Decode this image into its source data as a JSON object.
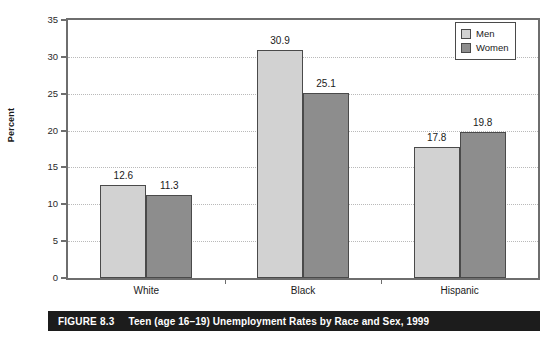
{
  "chart_data": {
    "type": "bar",
    "title": "Teen (age 16–19) Unemployment Rates by Race and Sex, 1999",
    "xlabel": "",
    "ylabel": "Percent",
    "categories": [
      "White",
      "Black",
      "Hispanic"
    ],
    "series": [
      {
        "name": "Men",
        "values": [
          12.6,
          30.9,
          17.8
        ],
        "color": "#d2d2d2"
      },
      {
        "name": "Women",
        "values": [
          11.3,
          25.1,
          19.8
        ],
        "color": "#8d8d8d"
      }
    ],
    "ylim": [
      0,
      35
    ],
    "yticks": [
      0,
      5,
      10,
      15,
      20,
      25,
      30,
      35
    ],
    "ytick_labels": [
      "0",
      "5",
      "10",
      "15",
      "20",
      "25",
      "30",
      "35"
    ],
    "grid": true,
    "legend_position": "top-right",
    "bar_labels": [
      [
        "12.6",
        "11.3"
      ],
      [
        "30.9",
        "25.1"
      ],
      [
        "17.8",
        "19.8"
      ]
    ]
  },
  "legend": {
    "items": [
      {
        "label": "Men",
        "color": "#d2d2d2"
      },
      {
        "label": "Women",
        "color": "#8d8d8d"
      }
    ]
  },
  "caption": {
    "number": "FIGURE 8.3",
    "title": "Teen (age 16–19) Unemployment Rates by Race and Sex, 1999",
    "background": "#1c1c1c",
    "text_color": "#ffffff"
  },
  "axis": {
    "y_title": "Percent"
  }
}
